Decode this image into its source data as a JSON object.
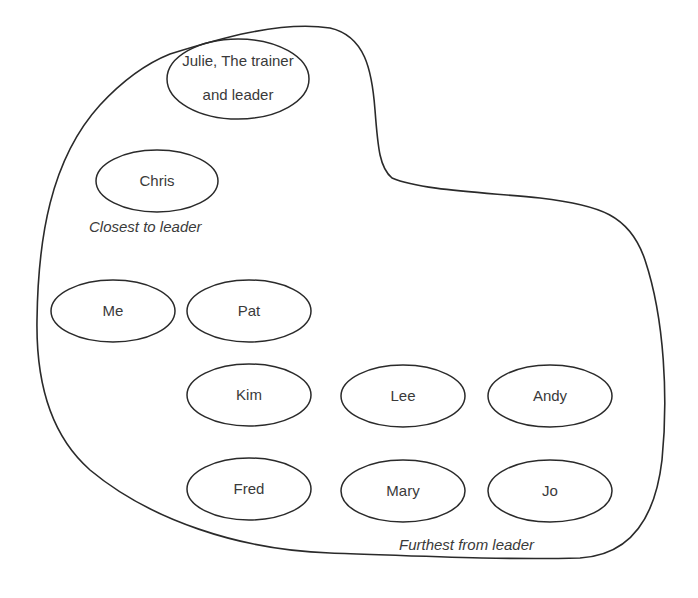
{
  "diagram": {
    "outline": "group boundary",
    "nodes": [
      {
        "id": "julie",
        "lines": [
          "Julie, The trainer",
          "and leader"
        ],
        "cx": 238,
        "cy": 79,
        "rx": 71,
        "ry": 40
      },
      {
        "id": "chris",
        "lines": [
          "Chris"
        ],
        "cx": 157,
        "cy": 181,
        "rx": 61,
        "ry": 31
      },
      {
        "id": "me",
        "lines": [
          "Me"
        ],
        "cx": 113,
        "cy": 311,
        "rx": 62,
        "ry": 31
      },
      {
        "id": "pat",
        "lines": [
          "Pat"
        ],
        "cx": 249,
        "cy": 311,
        "rx": 62,
        "ry": 31
      },
      {
        "id": "kim",
        "lines": [
          "Kim"
        ],
        "cx": 249,
        "cy": 395,
        "rx": 62,
        "ry": 31
      },
      {
        "id": "lee",
        "lines": [
          "Lee"
        ],
        "cx": 403,
        "cy": 396,
        "rx": 62,
        "ry": 31
      },
      {
        "id": "andy",
        "lines": [
          "Andy"
        ],
        "cx": 550,
        "cy": 396,
        "rx": 62,
        "ry": 31
      },
      {
        "id": "fred",
        "lines": [
          "Fred"
        ],
        "cx": 249,
        "cy": 489,
        "rx": 62,
        "ry": 31
      },
      {
        "id": "mary",
        "lines": [
          "Mary"
        ],
        "cx": 403,
        "cy": 491,
        "rx": 62,
        "ry": 31
      },
      {
        "id": "jo",
        "lines": [
          "Jo"
        ],
        "cx": 550,
        "cy": 491,
        "rx": 62,
        "ry": 31
      }
    ],
    "annotations": {
      "closest": "Closest to leader",
      "furthest": "Furthest from leader"
    }
  }
}
